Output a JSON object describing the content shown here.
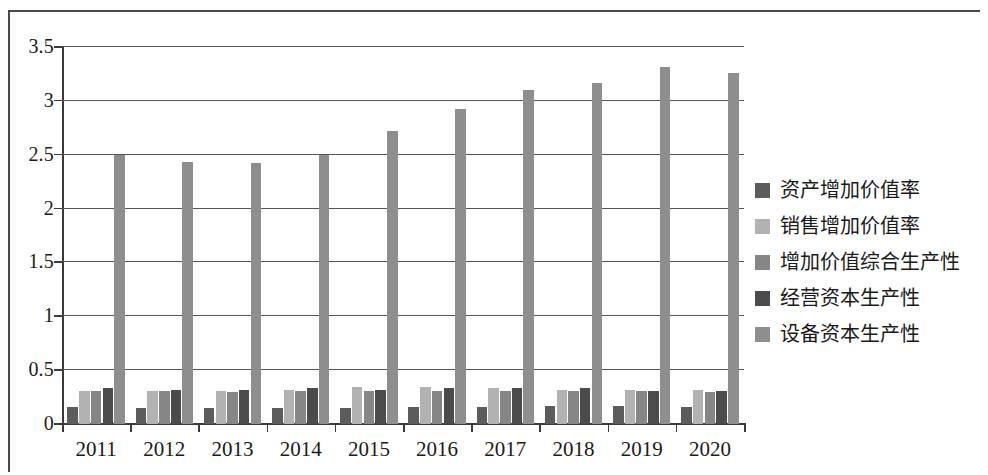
{
  "chart_data": {
    "type": "bar",
    "title": "",
    "subtitle": "",
    "xlabel": "",
    "ylabel": "",
    "categories": [
      "2011",
      "2012",
      "2013",
      "2014",
      "2015",
      "2016",
      "2017",
      "2018",
      "2019",
      "2020"
    ],
    "ylim": [
      0,
      3.5
    ],
    "y_ticks": [
      "0",
      "0.5",
      "1",
      "1.5",
      "2",
      "2.5",
      "3",
      "3.5"
    ],
    "y_tick_values": [
      0,
      0.5,
      1,
      1.5,
      2,
      2.5,
      3,
      3.5
    ],
    "grid": true,
    "legend_position": "right",
    "series": [
      {
        "name": "资产增加价值率",
        "color": "#5c5c5c",
        "values": [
          0.16,
          0.15,
          0.15,
          0.15,
          0.15,
          0.16,
          0.16,
          0.17,
          0.17,
          0.16
        ]
      },
      {
        "name": "销售增加价值率",
        "color": "#b2b2b2",
        "values": [
          0.31,
          0.31,
          0.31,
          0.32,
          0.34,
          0.34,
          0.33,
          0.32,
          0.32,
          0.32
        ]
      },
      {
        "name": "增加价值综合生产性",
        "color": "#868686",
        "values": [
          0.31,
          0.31,
          0.3,
          0.31,
          0.31,
          0.31,
          0.31,
          0.31,
          0.31,
          0.3
        ]
      },
      {
        "name": "经营资本生产性",
        "color": "#4b4b4b",
        "values": [
          0.33,
          0.32,
          0.32,
          0.33,
          0.32,
          0.33,
          0.33,
          0.33,
          0.31,
          0.31
        ]
      },
      {
        "name": "设备资本生产性",
        "color": "#8e8e8e",
        "values": [
          2.5,
          2.43,
          2.42,
          2.5,
          2.72,
          2.92,
          3.1,
          3.17,
          3.31,
          3.26
        ]
      }
    ]
  },
  "legend": {
    "items": [
      {
        "label": "资产增加价值率",
        "swatch": "#5c5c5c"
      },
      {
        "label": "销售增加价值率",
        "swatch": "#b2b2b2"
      },
      {
        "label": "增加价值综合生产性",
        "swatch": "#868686"
      },
      {
        "label": "经营资本生产性",
        "swatch": "#4b4b4b"
      },
      {
        "label": "设备资本生产性",
        "swatch": "#8e8e8e"
      }
    ]
  },
  "axes": {
    "y_max_label": "3.5",
    "y_min_label": "0"
  }
}
